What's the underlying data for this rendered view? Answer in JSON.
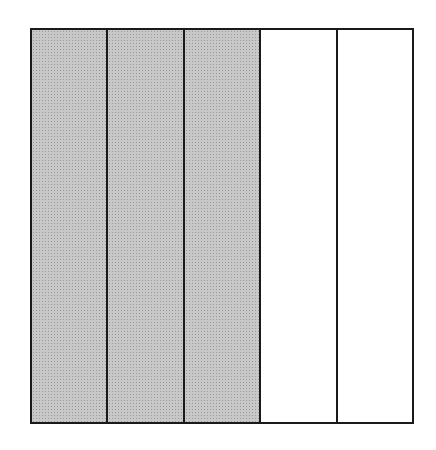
{
  "diagram": {
    "type": "fraction-model",
    "total_parts": 5,
    "shaded_parts": 3,
    "parts": [
      {
        "index": 0,
        "shaded": true
      },
      {
        "index": 1,
        "shaded": true
      },
      {
        "index": 2,
        "shaded": true
      },
      {
        "index": 3,
        "shaded": false
      },
      {
        "index": 4,
        "shaded": false
      }
    ],
    "colors": {
      "border": "#1a1a1a",
      "shaded": "#c8c8c8",
      "empty": "#ffffff"
    }
  }
}
